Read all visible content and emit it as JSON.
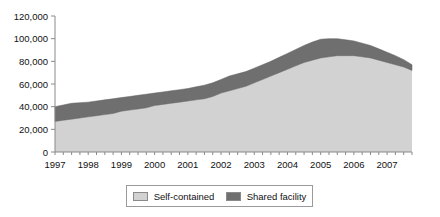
{
  "chart_data": {
    "type": "area",
    "stacked": true,
    "title": "",
    "xlabel": "",
    "ylabel": "",
    "ylim": [
      0,
      120000
    ],
    "xlim": [
      1997,
      2007.75
    ],
    "grid": false,
    "legend_position": "bottom",
    "ytick_labels": [
      "0",
      "20,000",
      "40,000",
      "60,000",
      "80,000",
      "100,000",
      "120,000"
    ],
    "ytick_values": [
      0,
      20000,
      40000,
      60000,
      80000,
      100000,
      120000
    ],
    "xtick_labels": [
      "1997",
      "1998",
      "1999",
      "2000",
      "2001",
      "2002",
      "2003",
      "2004",
      "2005",
      "2006",
      "2007"
    ],
    "xtick_values": [
      1997,
      1998,
      1999,
      2000,
      2001,
      2002,
      2003,
      2004,
      2005,
      2006,
      2007
    ],
    "minor_tick_interval": 0.25,
    "x": [
      1997,
      1997.25,
      1997.5,
      1997.75,
      1998,
      1998.25,
      1998.5,
      1998.75,
      1999,
      1999.25,
      1999.5,
      1999.75,
      2000,
      2000.25,
      2000.5,
      2000.75,
      2001,
      2001.25,
      2001.5,
      2001.75,
      2002,
      2002.25,
      2002.5,
      2002.75,
      2003,
      2003.25,
      2003.5,
      2003.75,
      2004,
      2004.25,
      2004.5,
      2004.75,
      2005,
      2005.25,
      2005.5,
      2005.75,
      2006,
      2006.25,
      2006.5,
      2006.75,
      2007,
      2007.25,
      2007.5,
      2007.75
    ],
    "series": [
      {
        "name": "Self-contained",
        "color": "#d2d2d2",
        "values": [
          27000,
          28000,
          29000,
          30000,
          31000,
          32000,
          33000,
          34000,
          36000,
          37000,
          38000,
          39000,
          41000,
          42000,
          43000,
          44000,
          45000,
          46000,
          47000,
          49000,
          52000,
          54000,
          56000,
          58000,
          61000,
          64000,
          67000,
          70000,
          73000,
          76000,
          79000,
          81000,
          83000,
          84000,
          85000,
          85000,
          85000,
          84000,
          83000,
          81000,
          79000,
          77000,
          75000,
          72000
        ]
      },
      {
        "name": "Shared facility",
        "color": "#6f6f6f",
        "values": [
          13000,
          13500,
          14000,
          13500,
          13000,
          13000,
          13000,
          13000,
          12000,
          12000,
          12000,
          12000,
          11000,
          11000,
          11000,
          11000,
          11000,
          11500,
          12000,
          12000,
          12000,
          13000,
          13000,
          13000,
          13000,
          13000,
          13000,
          13500,
          14000,
          14500,
          15000,
          16000,
          16500,
          16000,
          15000,
          14000,
          13000,
          12000,
          11000,
          10000,
          9000,
          8000,
          6500,
          5000
        ]
      }
    ],
    "totals": [
      40000,
      41500,
      43000,
      43500,
      44000,
      45000,
      46000,
      47000,
      48000,
      49000,
      50000,
      51000,
      52000,
      53000,
      54000,
      55000,
      56000,
      57500,
      59000,
      61000,
      64000,
      67000,
      69000,
      71000,
      74000,
      77000,
      80000,
      83500,
      87000,
      90500,
      94000,
      97000,
      99500,
      100000,
      100000,
      99000,
      98000,
      96000,
      94000,
      91000,
      88000,
      85000,
      81500,
      77000
    ]
  },
  "legend": {
    "items": [
      {
        "label": "Self-contained",
        "color": "#d2d2d2"
      },
      {
        "label": "Shared facility",
        "color": "#6f6f6f"
      }
    ]
  }
}
